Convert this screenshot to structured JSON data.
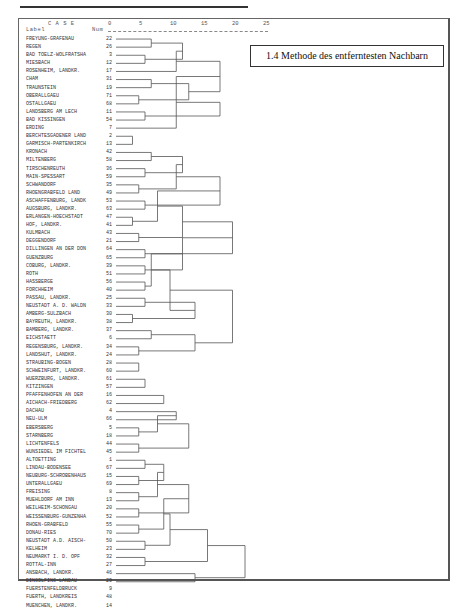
{
  "header": {
    "case_label": "C A S E",
    "label_col": "Label",
    "num_col": "Num"
  },
  "title": "1.4 Methode des entferntesten Nachbarn",
  "chart_data": {
    "type": "dendrogram",
    "title": "1.4 Methode des entferntesten Nachbarn",
    "xlabel": "Rescaled Distance Cluster Combine",
    "x_ticks": [
      0,
      5,
      10,
      15,
      20,
      25
    ],
    "x_range": [
      0,
      25
    ],
    "cases": [
      {
        "label": "FREYUNG-GRAFENAU",
        "num": "22"
      },
      {
        "label": "REGEN",
        "num": "26"
      },
      {
        "label": "BAD TOELZ-WOLFRATSHA",
        "num": "3"
      },
      {
        "label": "MIESBACH",
        "num": "12"
      },
      {
        "label": "ROSENHEIM, LANDKR.",
        "num": "17"
      },
      {
        "label": "CHAM",
        "num": "31"
      },
      {
        "label": "TRAUNSTEIN",
        "num": "19"
      },
      {
        "label": "OBERALLGAEU",
        "num": "71"
      },
      {
        "label": "OSTALLGAEU",
        "num": "68"
      },
      {
        "label": "LANDSBERG AM LECH",
        "num": "11"
      },
      {
        "label": "BAD KISSINGEN",
        "num": "54"
      },
      {
        "label": "ERDING",
        "num": "7"
      },
      {
        "label": "BERCHTESGADENER LAND",
        "num": "2"
      },
      {
        "label": "GARMISCH-PARTENKIRCH",
        "num": "13"
      },
      {
        "label": "KRONACH",
        "num": "42"
      },
      {
        "label": "MILTENBERG",
        "num": "58"
      },
      {
        "label": "TIRSCHENREUTH",
        "num": "36"
      },
      {
        "label": "MAIN-SPESSART",
        "num": "59"
      },
      {
        "label": "SCHWANDORF",
        "num": "35"
      },
      {
        "label": "RHOENGRABFELD LAND",
        "num": "49"
      },
      {
        "label": "ASCHAFFENBURG, LANDK",
        "num": "53"
      },
      {
        "label": "AUGSBURG, LANDKR.",
        "num": "63"
      },
      {
        "label": "ERLANGEN-HOECHSTADT",
        "num": "47"
      },
      {
        "label": "HOF, LANDKR.",
        "num": "41"
      },
      {
        "label": "KULMBACH",
        "num": "43"
      },
      {
        "label": "DEGGENDORF",
        "num": "21"
      },
      {
        "label": "DILLINGEN AN DER DON",
        "num": "64"
      },
      {
        "label": "GUENZBURG",
        "num": "65"
      },
      {
        "label": "COBURG, LANDKR.",
        "num": "39"
      },
      {
        "label": "ROTH",
        "num": "51"
      },
      {
        "label": "HASSBERGE",
        "num": "56"
      },
      {
        "label": "FORCHHEIM",
        "num": "40"
      },
      {
        "label": "PASSAU, LANDKR.",
        "num": "25"
      },
      {
        "label": "NEUSTADT A. D. WALDN",
        "num": "33"
      },
      {
        "label": "AMBERG-SULZBACH",
        "num": "30"
      },
      {
        "label": "BAYREUTH, LANDKR.",
        "num": "38"
      },
      {
        "label": "BAMBERG, LANDKR.",
        "num": "37"
      },
      {
        "label": "EICHSTAETT",
        "num": "6"
      },
      {
        "label": "REGENSBURG, LANDKR.",
        "num": "34"
      },
      {
        "label": "LANDSHUT, LANDKR.",
        "num": "24"
      },
      {
        "label": "STRAUBING-BOGEN",
        "num": "28"
      },
      {
        "label": "SCHWEINFURT, LANDKR.",
        "num": "60"
      },
      {
        "label": "WUERZBURG, LANDKR.",
        "num": "61"
      },
      {
        "label": "KITZINGEN",
        "num": "57"
      },
      {
        "label": "PFAFFENHOFEN AN DER",
        "num": "16"
      },
      {
        "label": "AICHACH-FRIEDBERG",
        "num": "62"
      },
      {
        "label": "DACHAU",
        "num": "4"
      },
      {
        "label": "NEU-ULM",
        "num": "66"
      },
      {
        "label": "EBERSBERG",
        "num": "5"
      },
      {
        "label": "STARNBERG",
        "num": "18"
      },
      {
        "label": "LICHTENFELS",
        "num": "44"
      },
      {
        "label": "WUNSIEDEL IM FICHTEL",
        "num": "45"
      },
      {
        "label": "ALTOETTING",
        "num": "1"
      },
      {
        "label": "LINDAU-BODENSEE",
        "num": "67"
      },
      {
        "label": "NEUBURG-SCHROBENHAUS",
        "num": "15"
      },
      {
        "label": "UNTERALLGAEU",
        "num": "69"
      },
      {
        "label": "FREISING",
        "num": "8"
      },
      {
        "label": "MUEHLDORF AM INN",
        "num": "13"
      },
      {
        "label": "WEILHEIM-SCHONGAU",
        "num": "20"
      },
      {
        "label": "WEISSENBURG-GUNZENHA",
        "num": "52"
      },
      {
        "label": "RHOEN-GRABFELD",
        "num": "55"
      },
      {
        "label": "DONAU-RIES",
        "num": "70"
      },
      {
        "label": "NEUSTADT A.D. AISCH-",
        "num": "50"
      },
      {
        "label": "KELHEIM",
        "num": "23"
      },
      {
        "label": "NEUMARKT I. D. OPF",
        "num": "32"
      },
      {
        "label": "ROTTAL-INN",
        "num": "27"
      },
      {
        "label": "ANSBACH, LANDKR.",
        "num": "46"
      },
      {
        "label": "DINGOLFING-LANDAU",
        "num": "29"
      },
      {
        "label": "FUERSTENFELDBRUCK",
        "num": "9"
      },
      {
        "label": "FUERTH, LANDKREIS",
        "num": "48"
      },
      {
        "label": "MUENCHEN, LANDKR.",
        "num": "14"
      }
    ],
    "merges_px": [
      [
        0,
        1,
        5
      ],
      [
        2,
        3,
        4
      ],
      [
        "a",
        "b",
        10
      ],
      [
        5,
        6,
        5
      ],
      [
        7,
        8,
        3
      ],
      [
        4,
        "c",
        9
      ],
      [
        "d",
        "e",
        11
      ],
      [
        "f",
        "g",
        16
      ],
      [
        9,
        10,
        4
      ],
      [
        11,
        "h",
        9
      ],
      [
        "i",
        "j",
        16
      ],
      [
        "k",
        "l",
        21
      ],
      [
        12,
        13,
        2
      ],
      [
        "m",
        "n",
        30
      ],
      [
        14,
        15,
        5
      ],
      [
        16,
        17,
        4
      ],
      [
        "o",
        "p",
        10
      ],
      [
        18,
        19,
        3
      ],
      [
        20,
        21,
        4
      ],
      [
        "q",
        "r",
        9
      ],
      [
        "s",
        "t",
        16
      ],
      [
        22,
        23,
        2
      ],
      [
        24,
        25,
        3
      ],
      [
        "u",
        "v",
        6
      ],
      [
        26,
        27,
        4
      ],
      [
        "w",
        "x",
        10
      ],
      [
        "y",
        "z",
        18
      ],
      [
        28,
        29,
        4
      ],
      [
        30,
        31,
        4
      ],
      [
        "A",
        "B",
        10
      ],
      [
        32,
        33,
        4
      ],
      [
        34,
        35,
        2
      ],
      [
        "C",
        "D",
        5
      ],
      [
        "E",
        "F",
        12
      ],
      [
        36,
        37,
        5
      ],
      [
        38,
        39,
        3
      ],
      [
        "G",
        "H",
        8
      ],
      [
        "I",
        "J",
        12
      ],
      [
        "K",
        "L",
        18
      ],
      [
        "M",
        "N",
        26
      ],
      [
        "O",
        "P",
        30
      ],
      [
        40,
        41,
        3
      ],
      [
        42,
        43,
        4
      ],
      [
        "Q",
        "R",
        7
      ],
      [
        44,
        45,
        7
      ],
      [
        "S",
        "T",
        12
      ],
      [
        46,
        47,
        9
      ],
      [
        48,
        49,
        3
      ],
      [
        50,
        51,
        3
      ],
      [
        "U",
        "V",
        6
      ],
      [
        "W",
        "X",
        11
      ],
      [
        "Y",
        "Z",
        15
      ],
      [
        52,
        53,
        4
      ],
      [
        54,
        55,
        3
      ],
      [
        "aa",
        "ab",
        7
      ],
      [
        56,
        57,
        3
      ],
      [
        58,
        59,
        3
      ],
      [
        "ac",
        "ad",
        6
      ],
      [
        "ae",
        "af",
        11
      ],
      [
        60,
        61,
        3
      ],
      [
        62,
        63,
        4
      ],
      [
        "ag",
        "ah",
        7
      ],
      [
        64,
        65,
        4
      ],
      [
        "ai",
        "aj",
        8
      ],
      [
        66,
        67,
        12
      ],
      [
        "ak",
        "al",
        14
      ],
      [
        "am",
        "an",
        20
      ],
      [
        "ao",
        "ap",
        28
      ],
      [
        68,
        69,
        6
      ],
      [
        "aq",
        70,
        17
      ],
      [
        "ar",
        "as",
        38
      ],
      [
        "at",
        "au",
        48
      ]
    ]
  }
}
